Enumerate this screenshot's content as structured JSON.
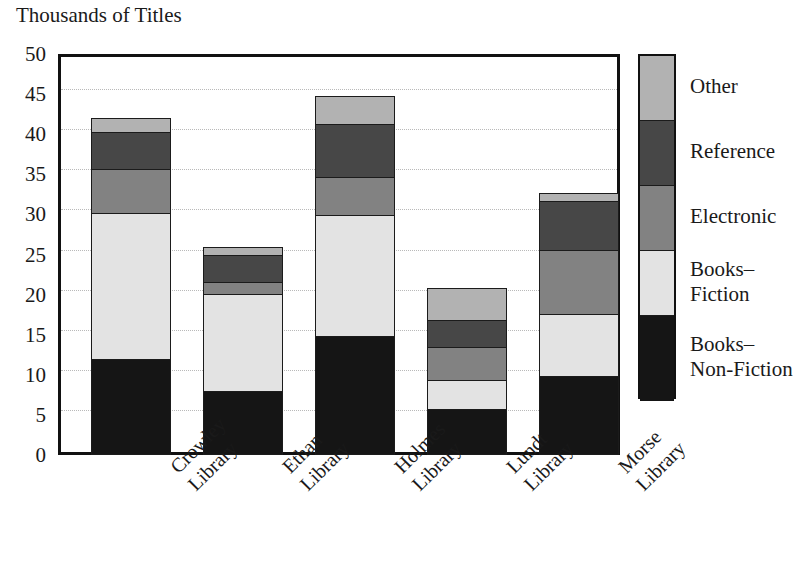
{
  "chart_data": {
    "type": "bar",
    "subtype": "stacked-bar",
    "title": "",
    "ylabel": "Thousands of Titles",
    "xlabel": "",
    "ylim": [
      0,
      50
    ],
    "ytick_step": 5,
    "yticks": [
      50,
      45,
      40,
      35,
      30,
      25,
      20,
      15,
      10,
      5,
      0
    ],
    "grid": true,
    "legend_position": "right",
    "categories": [
      "Crowley Library",
      "Ethan Library",
      "Holmes Library",
      "Lundt Library",
      "Morse Library"
    ],
    "category_lines": [
      [
        "Crowley",
        "Library"
      ],
      [
        "Ethan",
        "Library"
      ],
      [
        "Holmes",
        "Library"
      ],
      [
        "Lundt",
        "Library"
      ],
      [
        "Morse",
        "Library"
      ]
    ],
    "series": [
      {
        "name": "Books–Non-Fiction",
        "color": "#151515",
        "values": [
          11.9,
          7.9,
          14.7,
          5.6,
          9.7
        ]
      },
      {
        "name": "Books–Fiction",
        "color": "#e3e3e3",
        "values": [
          18.1,
          12.1,
          15.1,
          3.6,
          7.8
        ]
      },
      {
        "name": "Electronic",
        "color": "#828282",
        "values": [
          5.5,
          1.5,
          4.7,
          4.1,
          7.9
        ]
      },
      {
        "name": "Reference",
        "color": "#474747",
        "values": [
          4.6,
          3.3,
          6.7,
          3.4,
          6.2
        ]
      },
      {
        "name": "Other",
        "color": "#b2b2b2",
        "values": [
          1.8,
          1.0,
          3.4,
          4.0,
          0.9
        ]
      }
    ],
    "totals": [
      41.9,
      25.8,
      44.6,
      20.7,
      32.5
    ]
  },
  "legend": {
    "entries": [
      {
        "label": "Other",
        "lines": [
          "Other"
        ],
        "color": "#b2b2b2"
      },
      {
        "label": "Reference",
        "lines": [
          "Reference"
        ],
        "color": "#474747"
      },
      {
        "label": "Electronic",
        "lines": [
          "Electronic"
        ],
        "color": "#828282"
      },
      {
        "label": "Books–Fiction",
        "lines": [
          "Books–",
          "Fiction"
        ],
        "color": "#e3e3e3"
      },
      {
        "label": "Books–Non-Fiction",
        "lines": [
          "Books–",
          "Non-Fiction"
        ],
        "color": "#151515"
      }
    ]
  },
  "axis": {
    "y_title": "Thousands of Titles",
    "tick_labels": [
      "50",
      "45",
      "40",
      "35",
      "30",
      "25",
      "20",
      "15",
      "10",
      "5",
      "0"
    ]
  },
  "colors": {
    "frame": "#111111",
    "gridline": "#b9b9b9",
    "background": "#ffffff",
    "text": "#1a1a1a"
  }
}
